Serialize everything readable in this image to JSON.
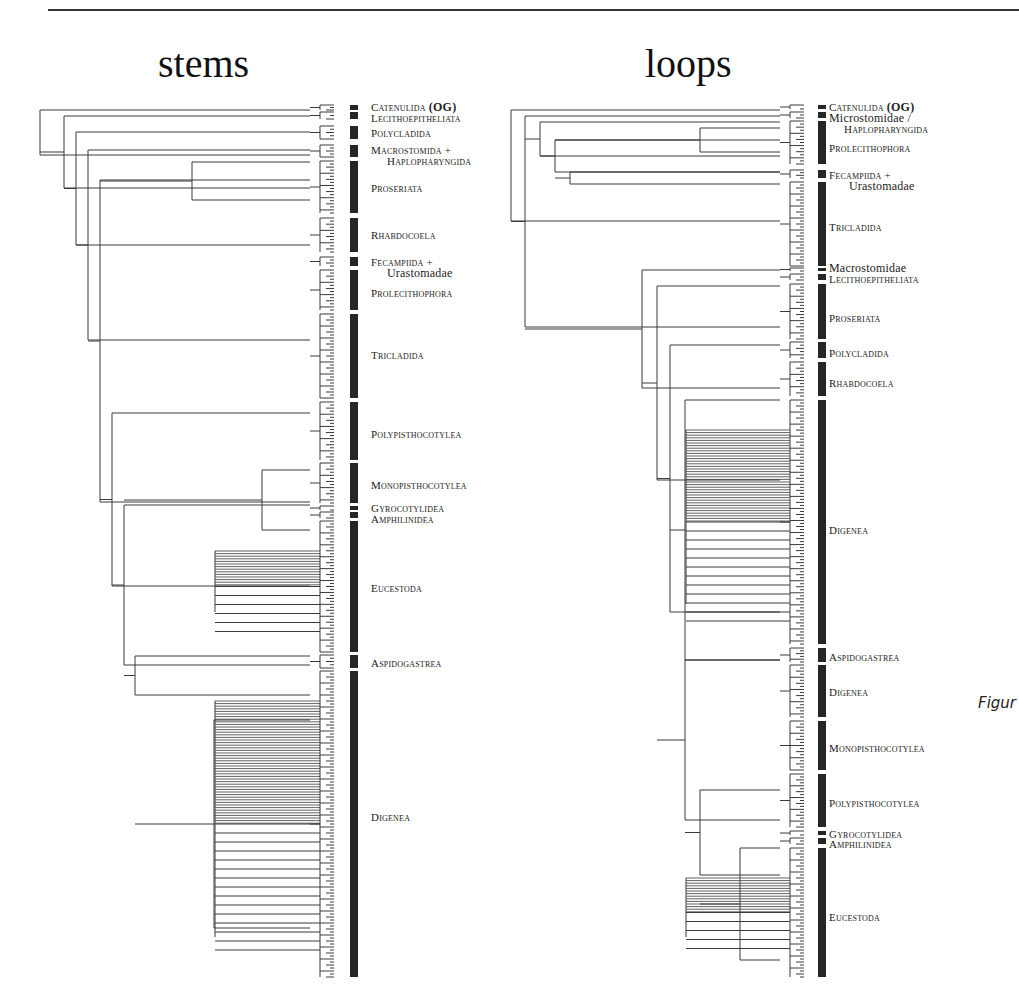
{
  "page": {
    "figure_caption_fragment": "Figur"
  },
  "panels": [
    {
      "id": "stems",
      "title": "stems",
      "title_left": 158,
      "tree": {
        "x_root": 40,
        "x_tip": 334,
        "bar_x": 350,
        "bar_w": 8,
        "label_x": 371,
        "tips_top": 107,
        "tips_bottom": 976
      },
      "clades": [
        {
          "label": "Catenulida",
          "suffix": "(OG)",
          "y0": 105,
          "y1": 110,
          "label_y": 102,
          "indent": 0
        },
        {
          "label": "Lecithoepitheliata",
          "y0": 112,
          "y1": 119,
          "label_y": 113,
          "indent": 0
        },
        {
          "label": "Polycladida",
          "y0": 126,
          "y1": 139,
          "label_y": 128,
          "indent": 0
        },
        {
          "label": "Macrostomida +",
          "y0": 145,
          "y1": 157,
          "label_y": 145,
          "indent": 0
        },
        {
          "label": "Haplopharyngida",
          "y0": -1,
          "y1": -1,
          "label_y": 156,
          "indent": 16
        },
        {
          "label": "Proseriata",
          "y0": 161,
          "y1": 213,
          "label_y": 183,
          "indent": 0
        },
        {
          "label": "Rhabdocoela",
          "y0": 218,
          "y1": 252,
          "label_y": 230,
          "indent": 0
        },
        {
          "label": "Fecampiida +",
          "y0": 257,
          "y1": 266,
          "label_y": 257,
          "indent": 0
        },
        {
          "label": "Urastomadae",
          "y0": -1,
          "y1": -1,
          "label_y": 268,
          "indent": 16,
          "plain": true
        },
        {
          "label": "Prolecithophora",
          "y0": 270,
          "y1": 310,
          "label_y": 288,
          "indent": 0
        },
        {
          "label": "Tricladida",
          "y0": 314,
          "y1": 398,
          "label_y": 350,
          "indent": 0
        },
        {
          "label": "Polypisthocotylea",
          "y0": 402,
          "y1": 460,
          "label_y": 429,
          "indent": 0
        },
        {
          "label": "Monopisthocotylea",
          "y0": 463,
          "y1": 503,
          "label_y": 480,
          "indent": 0
        },
        {
          "label": "Gyrocotylidea",
          "y0": 506,
          "y1": 510,
          "label_y": 503,
          "indent": 0
        },
        {
          "label": "Amphilinidea",
          "y0": 512,
          "y1": 518,
          "label_y": 514,
          "indent": 0
        },
        {
          "label": "Eucestoda",
          "y0": 521,
          "y1": 652,
          "label_y": 583,
          "indent": 0
        },
        {
          "label": "Aspidogastrea",
          "y0": 655,
          "y1": 668,
          "label_y": 658,
          "indent": 0
        },
        {
          "label": "Digenea",
          "y0": 671,
          "y1": 977,
          "label_y": 812,
          "indent": 0
        }
      ],
      "branches": [
        {
          "x": 40,
          "y_top": 110,
          "y_bot": 155,
          "x_parent": 40
        },
        {
          "x": 64,
          "y_top": 116,
          "y_bot": 188,
          "x_parent": 40
        },
        {
          "x": 76,
          "y_top": 132,
          "y_bot": 245,
          "x_parent": 64
        },
        {
          "x": 88,
          "y_top": 150,
          "y_bot": 340,
          "x_parent": 76
        },
        {
          "x": 100,
          "y_top": 180,
          "y_bot": 502,
          "x_parent": 88
        },
        {
          "x": 192,
          "y_top": 162,
          "y_bot": 200,
          "x_parent": 100
        },
        {
          "x": 112,
          "y_top": 413,
          "y_bot": 586,
          "x_parent": 100
        },
        {
          "x": 124,
          "y_top": 505,
          "y_bot": 665,
          "x_parent": 112
        },
        {
          "x": 262,
          "y_top": 470,
          "y_bot": 530,
          "x_parent": 124
        },
        {
          "x": 135,
          "y_top": 656,
          "y_bot": 695,
          "x_parent": 124
        },
        {
          "x": 214,
          "y_top": 720,
          "y_bot": 928,
          "x_parent": 135
        }
      ]
    },
    {
      "id": "loops",
      "title": "loops",
      "title_left": 645,
      "tree": {
        "x_root": 511,
        "x_tip": 804,
        "bar_x": 818,
        "bar_w": 8,
        "label_x": 829,
        "tips_top": 107,
        "tips_bottom": 976
      },
      "clades": [
        {
          "label": "Catenulida",
          "suffix": "(OG)",
          "y0": 105,
          "y1": 109,
          "label_y": 102,
          "indent": 0
        },
        {
          "label": "Microstomidae /",
          "y0": 112,
          "y1": 118,
          "label_y": 113,
          "indent": 0,
          "plain": true
        },
        {
          "label": "Haplopharyngida",
          "y0": -1,
          "y1": -1,
          "label_y": 124,
          "indent": 15
        },
        {
          "label": "Prolecithophora",
          "y0": 121,
          "y1": 164,
          "label_y": 143,
          "indent": 0
        },
        {
          "label": "Fecampiida +",
          "y0": 170,
          "y1": 178,
          "label_y": 170,
          "indent": 0
        },
        {
          "label": "Urastomadae",
          "y0": -1,
          "y1": -1,
          "label_y": 181,
          "indent": 20,
          "plain": true
        },
        {
          "label": "Tricladida",
          "y0": 182,
          "y1": 266,
          "label_y": 222,
          "indent": 0
        },
        {
          "label": "Macrostomidae",
          "y0": 268,
          "y1": 271,
          "label_y": 263,
          "indent": 0,
          "plain": true
        },
        {
          "label": "Lecithoepitheliata",
          "y0": 274,
          "y1": 280,
          "label_y": 274,
          "indent": 0
        },
        {
          "label": "Proseriata",
          "y0": 284,
          "y1": 339,
          "label_y": 313,
          "indent": 0
        },
        {
          "label": "Polycladida",
          "y0": 342,
          "y1": 358,
          "label_y": 348,
          "indent": 0
        },
        {
          "label": "Rhabdocoela",
          "y0": 362,
          "y1": 396,
          "label_y": 378,
          "indent": 0
        },
        {
          "label": "Digenea",
          "y0": 400,
          "y1": 644,
          "label_y": 525,
          "indent": 0
        },
        {
          "label": "Aspidogastrea",
          "y0": 648,
          "y1": 662,
          "label_y": 652,
          "indent": 0
        },
        {
          "label": "Digenea",
          "y0": 665,
          "y1": 717,
          "label_y": 687,
          "indent": 0
        },
        {
          "label": "Monopisthocotylea",
          "y0": 721,
          "y1": 770,
          "label_y": 743,
          "indent": 0
        },
        {
          "label": "Polypisthocotylea",
          "y0": 774,
          "y1": 827,
          "label_y": 798,
          "indent": 0
        },
        {
          "label": "Gyrocotylidea",
          "y0": 831,
          "y1": 835,
          "label_y": 829,
          "indent": 0
        },
        {
          "label": "Amphilinidea",
          "y0": 838,
          "y1": 844,
          "label_y": 839,
          "indent": 0
        },
        {
          "label": "Eucestoda",
          "y0": 848,
          "y1": 977,
          "label_y": 912,
          "indent": 0
        }
      ],
      "branches": [
        {
          "x": 511,
          "y_top": 110,
          "y_bot": 221,
          "x_parent": 511
        },
        {
          "x": 525,
          "y_top": 116,
          "y_bot": 327,
          "x_parent": 511
        },
        {
          "x": 540,
          "y_top": 122,
          "y_bot": 156,
          "x_parent": 525
        },
        {
          "x": 555,
          "y_top": 140,
          "y_bot": 172,
          "x_parent": 540
        },
        {
          "x": 700,
          "y_top": 128,
          "y_bot": 152,
          "x_parent": 555
        },
        {
          "x": 570,
          "y_top": 172,
          "y_bot": 184,
          "x_parent": 555
        },
        {
          "x": 642,
          "y_top": 270,
          "y_bot": 388,
          "x_parent": 525
        },
        {
          "x": 657,
          "y_top": 286,
          "y_bot": 480,
          "x_parent": 642
        },
        {
          "x": 670,
          "y_top": 345,
          "y_bot": 612,
          "x_parent": 657
        },
        {
          "x": 685,
          "y_top": 400,
          "y_bot": 660,
          "x_parent": 670
        },
        {
          "x": 685,
          "y_top": 660,
          "y_bot": 820,
          "x_parent": 657
        },
        {
          "x": 700,
          "y_top": 790,
          "y_bot": 875,
          "x_parent": 685
        },
        {
          "x": 740,
          "y_top": 848,
          "y_bot": 960,
          "x_parent": 700
        }
      ]
    }
  ]
}
